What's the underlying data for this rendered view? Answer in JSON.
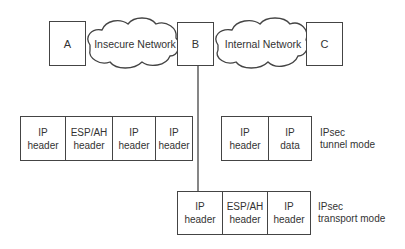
{
  "diagram": {
    "nodes": [
      {
        "id": "A",
        "label": "A"
      },
      {
        "id": "B",
        "label": "B"
      },
      {
        "id": "C",
        "label": "C"
      }
    ],
    "clouds": [
      {
        "id": "insecure",
        "label": "Insecure Network"
      },
      {
        "id": "internal",
        "label": "Internal Network"
      }
    ],
    "tunnel_packet": {
      "cells": [
        {
          "line1": "IP",
          "line2": "header"
        },
        {
          "line1": "ESP/AH",
          "line2": "header"
        },
        {
          "line1": "IP",
          "line2": "header"
        },
        {
          "line1": "IP",
          "line2": "header"
        }
      ]
    },
    "tunnel_inner": {
      "cells": [
        {
          "line1": "IP",
          "line2": "header"
        },
        {
          "line1": "IP",
          "line2": "data"
        }
      ],
      "label_line1": "IPsec",
      "label_line2": "tunnel mode"
    },
    "transport_packet": {
      "cells": [
        {
          "line1": "IP",
          "line2": "header"
        },
        {
          "line1": "ESP/AH",
          "line2": "header"
        },
        {
          "line1": "IP",
          "line2": "header"
        }
      ],
      "label_line1": "IPsec",
      "label_line2": "transport mode"
    }
  }
}
